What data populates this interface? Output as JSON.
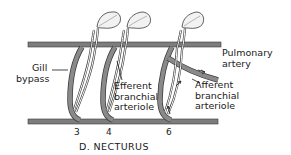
{
  "diagram": {
    "title": "D. NECTURUS",
    "colors": {
      "vessel": "#7d7d7d",
      "vessel_outline": "#3a3a3a",
      "gill": "#f2f2f2",
      "text": "#1a1a1a"
    },
    "labels": {
      "gill_bypass": [
        "Gill",
        "bypass"
      ],
      "efferent": [
        "Efferent",
        "branchial",
        "arteriole"
      ],
      "pulmonary": [
        "Pulmonary",
        "artery"
      ],
      "afferent": [
        "Afferent",
        "branchial",
        "arteriole"
      ]
    },
    "arches": [
      {
        "number": "3"
      },
      {
        "number": "4"
      },
      {
        "number": "6"
      }
    ]
  }
}
